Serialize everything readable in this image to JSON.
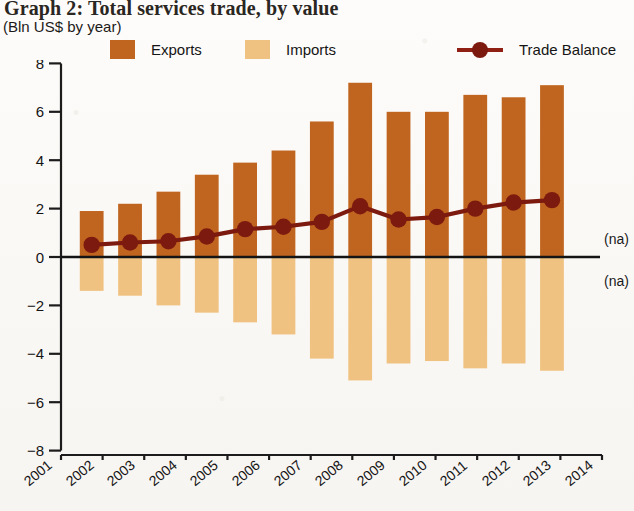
{
  "figure": {
    "title": "Graph 2: Total services trade, by value",
    "subtitle": "(Bln US$ by year)"
  },
  "legend": {
    "position": "top",
    "items": [
      {
        "label": "Exports",
        "color": "#c0651f",
        "marker": "square"
      },
      {
        "label": "Imports",
        "color": "#f0c282",
        "marker": "square"
      },
      {
        "label": "Trade Balance",
        "color": "#7c1a0f",
        "marker": "line-dot"
      }
    ]
  },
  "annotations": [
    {
      "text": "(na)",
      "x": "2014",
      "y": 0.55
    },
    {
      "text": "(na)",
      "x": "2014",
      "y": -1.2
    }
  ],
  "axes": {
    "y_ticks": [
      "8",
      "6",
      "4",
      "2",
      "0",
      "-2",
      "-4",
      "-6",
      "-8"
    ],
    "x_ticks": [
      "2001",
      "2002",
      "2003",
      "2004",
      "2005",
      "2006",
      "2007",
      "2008",
      "2009",
      "2010",
      "2011",
      "2012",
      "2013",
      "2014"
    ]
  },
  "chart_data": {
    "type": "bar",
    "title": "Graph 2: Total services trade, by value",
    "subtitle": "(Bln US$ by year)",
    "xlabel": "",
    "ylabel": "Bln US$",
    "ylim": [
      -8,
      8
    ],
    "ytick_interval": 2,
    "grid": false,
    "legend_position": "top",
    "categories": [
      "2001",
      "2002",
      "2003",
      "2004",
      "2005",
      "2006",
      "2007",
      "2008",
      "2009",
      "2010",
      "2011",
      "2012",
      "2013"
    ],
    "series": [
      {
        "name": "Exports",
        "type": "bar",
        "color": "#c0651f",
        "values": [
          1.9,
          2.2,
          2.7,
          3.4,
          3.9,
          4.4,
          5.6,
          7.2,
          6.0,
          6.0,
          6.7,
          6.6,
          7.1
        ]
      },
      {
        "name": "Imports",
        "type": "bar",
        "color": "#f0c282",
        "values": [
          -1.4,
          -1.6,
          -2.0,
          -2.3,
          -2.7,
          -3.2,
          -4.2,
          -5.1,
          -4.4,
          -4.3,
          -4.6,
          -4.4,
          -4.7
        ]
      },
      {
        "name": "Trade Balance",
        "type": "line",
        "color": "#7c1a0f",
        "values": [
          0.5,
          0.6,
          0.65,
          0.85,
          1.15,
          1.25,
          1.45,
          2.1,
          1.55,
          1.65,
          2.0,
          2.25,
          2.35
        ]
      }
    ]
  }
}
